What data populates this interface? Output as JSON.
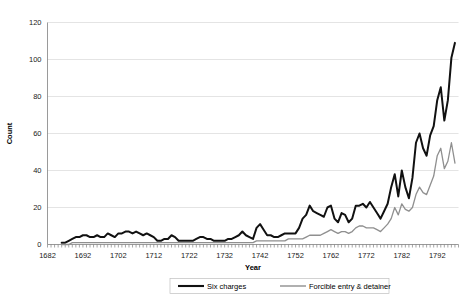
{
  "chart_data": {
    "type": "line",
    "title": "",
    "xlabel": "Year",
    "ylabel": "Count",
    "xlim": [
      1682,
      1798
    ],
    "ylim": [
      0,
      120
    ],
    "ytick_step": 20,
    "yticks": [
      0,
      20,
      40,
      60,
      80,
      100,
      120
    ],
    "xticks": [
      1682,
      1692,
      1702,
      1712,
      1722,
      1732,
      1742,
      1752,
      1762,
      1772,
      1782,
      1792
    ],
    "grid": "horizontal",
    "legend_position": "bottom",
    "colors": {
      "six_charges": "#111111",
      "forcible_entry": "#8f8f8f",
      "gridline": "#d9d9d9",
      "axis": "#808080",
      "text": "#000000"
    },
    "x": [
      1686,
      1687,
      1688,
      1689,
      1690,
      1691,
      1692,
      1693,
      1694,
      1695,
      1696,
      1697,
      1698,
      1699,
      1700,
      1701,
      1702,
      1703,
      1704,
      1705,
      1706,
      1707,
      1708,
      1709,
      1710,
      1711,
      1712,
      1713,
      1714,
      1715,
      1716,
      1717,
      1718,
      1719,
      1720,
      1721,
      1722,
      1723,
      1724,
      1725,
      1726,
      1727,
      1728,
      1729,
      1730,
      1731,
      1732,
      1733,
      1734,
      1735,
      1736,
      1737,
      1738,
      1739,
      1740,
      1741,
      1742,
      1743,
      1744,
      1745,
      1746,
      1747,
      1748,
      1749,
      1750,
      1751,
      1752,
      1753,
      1754,
      1755,
      1756,
      1757,
      1758,
      1759,
      1760,
      1761,
      1762,
      1763,
      1764,
      1765,
      1766,
      1767,
      1768,
      1769,
      1770,
      1771,
      1772,
      1773,
      1774,
      1775,
      1776,
      1777,
      1778,
      1779,
      1780,
      1781,
      1782,
      1783,
      1784,
      1785,
      1786,
      1787,
      1788,
      1789,
      1790,
      1791,
      1792,
      1793,
      1794,
      1795,
      1796,
      1797
    ],
    "series": [
      {
        "name": "Six charges",
        "values": [
          1,
          1,
          2,
          3,
          4,
          4,
          5,
          5,
          4,
          4,
          5,
          4,
          4,
          6,
          5,
          4,
          6,
          6,
          7,
          7,
          6,
          7,
          6,
          5,
          6,
          5,
          4,
          2,
          2,
          3,
          3,
          5,
          4,
          2,
          2,
          2,
          2,
          2,
          3,
          4,
          4,
          3,
          3,
          2,
          2,
          2,
          2,
          3,
          3,
          4,
          5,
          7,
          5,
          4,
          3,
          9,
          11,
          8,
          5,
          5,
          4,
          4,
          5,
          6,
          6,
          6,
          6,
          9,
          14,
          16,
          21,
          18,
          17,
          16,
          15,
          20,
          21,
          14,
          12,
          17,
          16,
          12,
          14,
          21,
          21,
          22,
          20,
          23,
          20,
          17,
          14,
          18,
          22,
          31,
          38,
          26,
          40,
          31,
          25,
          36,
          55,
          60,
          52,
          48,
          59,
          64,
          78,
          85,
          67,
          78,
          101,
          109
        ]
      },
      {
        "name": "Forcible entry & detainer",
        "values": [
          0,
          0,
          0,
          1,
          1,
          1,
          1,
          1,
          1,
          1,
          1,
          1,
          1,
          1,
          1,
          1,
          1,
          1,
          1,
          1,
          1,
          1,
          1,
          1,
          1,
          1,
          1,
          1,
          1,
          1,
          1,
          1,
          1,
          1,
          1,
          1,
          1,
          1,
          1,
          1,
          1,
          1,
          1,
          1,
          1,
          1,
          1,
          1,
          1,
          1,
          1,
          1,
          1,
          1,
          1,
          2,
          2,
          2,
          2,
          2,
          2,
          2,
          2,
          2,
          3,
          3,
          3,
          3,
          3,
          4,
          5,
          5,
          5,
          5,
          6,
          7,
          8,
          7,
          6,
          7,
          7,
          6,
          7,
          9,
          10,
          10,
          9,
          9,
          9,
          8,
          7,
          9,
          11,
          14,
          20,
          16,
          22,
          19,
          18,
          20,
          27,
          31,
          28,
          27,
          32,
          37,
          48,
          52,
          41,
          45,
          55,
          44
        ]
      }
    ]
  },
  "legend": {
    "items": [
      {
        "label": "Six charges",
        "color": "#111111",
        "width": 2.1
      },
      {
        "label": "Forcible entry & detainer",
        "color": "#8f8f8f",
        "width": 1.4
      }
    ]
  }
}
